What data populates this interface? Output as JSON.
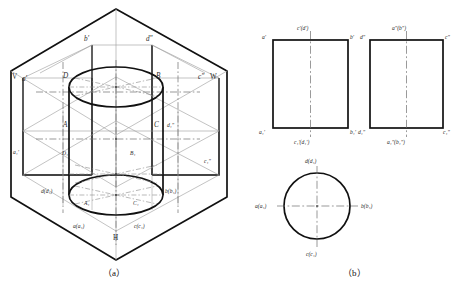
{
  "figure": {
    "captions": {
      "left": "（a）",
      "right": "（b）"
    }
  },
  "colors": {
    "outline": "#111111",
    "thin": "#8a8a8a",
    "center": "#6f6f6f",
    "hidden": "#8a8a8a",
    "background": "#ffffff"
  },
  "pictorial": {
    "plane_labels": [
      {
        "id": "plane-v",
        "text": "V"
      },
      {
        "id": "plane-w",
        "text": "W"
      },
      {
        "id": "plane-h",
        "text": "H"
      }
    ],
    "point_labels": [
      {
        "id": "b-prime",
        "text": "b'"
      },
      {
        "id": "d-dprime",
        "text": "d\""
      },
      {
        "id": "a-prime",
        "text": "a'"
      },
      {
        "id": "c-dprime",
        "text": "c\""
      },
      {
        "id": "solid-D",
        "text": "D"
      },
      {
        "id": "solid-B",
        "text": "B"
      },
      {
        "id": "solid-A",
        "text": "A"
      },
      {
        "id": "solid-C",
        "text": "C"
      },
      {
        "id": "d1-dprime",
        "text": "d₁\""
      },
      {
        "id": "a1-prime",
        "text": "a₁'"
      },
      {
        "id": "c1-dprime",
        "text": "c₁\""
      },
      {
        "id": "solid-D1",
        "text": "D₁"
      },
      {
        "id": "solid-B1",
        "text": "B₁"
      },
      {
        "id": "solid-A1",
        "text": "A₁"
      },
      {
        "id": "solid-C1",
        "text": "C₁"
      },
      {
        "id": "d-d1",
        "text": "d(d₁)"
      },
      {
        "id": "b-b1",
        "text": "b(b₁)"
      },
      {
        "id": "a-a1",
        "text": "a(a₁)"
      },
      {
        "id": "c-c1",
        "text": "c(c₁)"
      }
    ]
  },
  "views": {
    "front": {
      "name": "front-view",
      "shape": "rectangle",
      "labels": {
        "top_left": "a'",
        "top_center": "c'(d')",
        "top_right": "b'",
        "bottom_left": "a₁'",
        "bottom_center": "c₁'(d₁')",
        "bottom_right": "b₁'"
      }
    },
    "side": {
      "name": "side-view",
      "shape": "rectangle",
      "labels": {
        "top_left": "d\"",
        "top_center": "a\"(b\")",
        "top_right": "c\"",
        "bottom_left": "d₁\"",
        "bottom_center": "a₁\"(b₁\")",
        "bottom_right": "c₁\""
      }
    },
    "top": {
      "name": "top-view",
      "shape": "circle",
      "labels": {
        "top": "d(d₁)",
        "left": "a(a₁)",
        "right": "b(b₁)",
        "bottom": "c(c₁)"
      }
    }
  }
}
